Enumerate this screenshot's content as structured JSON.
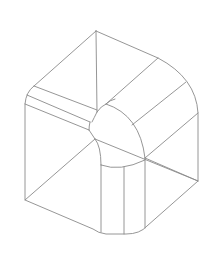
{
  "figure": {
    "stroke_color": "#8a8a8a",
    "background": "#ffffff"
  },
  "diagram": {
    "outline": [
      "M96 31 L158 58 Q196 78 198 113 L198 181 L147 226 Q140 234 126 234 L106 234 Q98 233 93 229 L25 200 L25 104 Q26 92 34 86 L96 31 Z"
    ],
    "edges": [
      "M96 31 L97 112",
      "M34 86 L97 110",
      "M27 95 L90 122",
      "M25 104 L89 130",
      "M97 112 Q94 118 92 122",
      "M90 122 Q89 126 89 130",
      "M89 130 L95 139",
      "M95 139 L198 181",
      "M25 200 L95 139",
      "M158 58 L106 104",
      "M106 104 Q110 100 115 99",
      "M97 112 Q101 106 106 104",
      "M106 104 Q140 115 145 158",
      "M186 82 L132 125",
      "M198 113 L145 158",
      "M145 158 L198 181",
      "M95 139 Q101 146 101 165",
      "M101 165 L101 232",
      "M101 165 Q120 172 145 160",
      "M124 167 L124 234",
      "M145 158 L145 228"
    ]
  }
}
